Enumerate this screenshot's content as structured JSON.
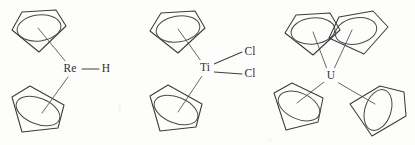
{
  "figure": {
    "type": "chemical-structure-diagram",
    "background_color": "#fdfdfc",
    "line_color": "#3b3b3b",
    "label_color": "#2f2f2f",
    "width": 415,
    "height": 145
  },
  "structures": [
    {
      "id": "rhenocene-hydride",
      "name": "Cp2ReH",
      "center_label": "Re",
      "center_x": 70,
      "center_y": 69,
      "ligand_labels": [
        "H"
      ],
      "cp_ring_count": 2,
      "bonds": [
        {
          "from": "Re",
          "to": "cp-top",
          "type": "hapto"
        },
        {
          "from": "Re",
          "to": "cp-bottom",
          "type": "hapto"
        },
        {
          "from": "Re",
          "to": "H",
          "type": "sigma"
        }
      ],
      "terminal_atoms": [
        {
          "label": "H",
          "x": 106,
          "y": 69
        }
      ]
    },
    {
      "id": "titanocene-dichloride",
      "name": "Cp2TiCl2",
      "center_label": "Ti",
      "center_x": 205,
      "center_y": 68,
      "ligand_labels": [
        "Cl",
        "Cl"
      ],
      "cp_ring_count": 2,
      "bonds": [
        {
          "from": "Ti",
          "to": "cp-top",
          "type": "hapto"
        },
        {
          "from": "Ti",
          "to": "cp-bottom",
          "type": "hapto"
        },
        {
          "from": "Ti",
          "to": "Cl-upper",
          "type": "sigma"
        },
        {
          "from": "Ti",
          "to": "Cl-lower",
          "type": "sigma"
        }
      ],
      "terminal_atoms": [
        {
          "label": "Cl",
          "x": 250,
          "y": 52
        },
        {
          "label": "Cl",
          "x": 250,
          "y": 74
        }
      ]
    },
    {
      "id": "tetrakis-cyclopentadienyl-uranium",
      "name": "Cp4U",
      "center_label": "U",
      "center_x": 330,
      "center_y": 76,
      "ligand_labels": [],
      "cp_ring_count": 4,
      "bonds": [
        {
          "from": "U",
          "to": "cp-top-left",
          "type": "hapto"
        },
        {
          "from": "U",
          "to": "cp-top-right",
          "type": "hapto"
        },
        {
          "from": "U",
          "to": "cp-bottom-left",
          "type": "hapto"
        },
        {
          "from": "U",
          "to": "cp-bottom-right",
          "type": "hapto"
        }
      ],
      "terminal_atoms": []
    }
  ],
  "atom_labels": {
    "rhenium": "Re",
    "hydrogen": "H",
    "titanium": "Ti",
    "chlorine_upper": "Cl",
    "chlorine_lower": "Cl",
    "uranium": "U"
  }
}
